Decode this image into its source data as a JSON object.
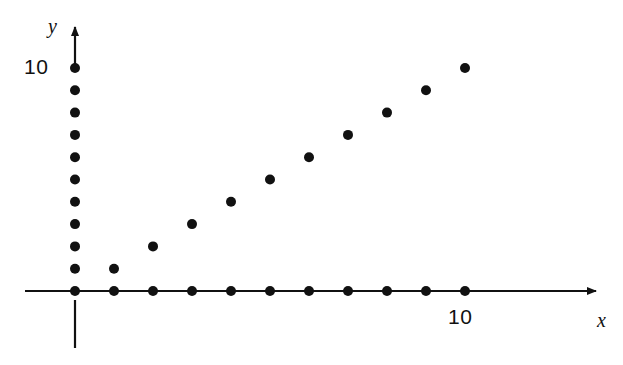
{
  "figure": {
    "background_color": "#ffffff",
    "ink_color": "#111111",
    "width": 623,
    "height": 365
  },
  "axes": {
    "x": {
      "name": "x",
      "icon": "arrow-right-icon",
      "tick_labels": [
        "10"
      ],
      "origin_px": {
        "x": 75,
        "y": 291
      },
      "unit_px": 39.0,
      "line_start_px": 25,
      "line_end_px": 600,
      "below_origin_tick": {
        "from_y": 300,
        "to_y": 348
      }
    },
    "y": {
      "name": "y",
      "icon": "arrow-up-icon",
      "tick_labels": [
        "10"
      ],
      "origin_px": {
        "x": 75,
        "y": 291
      },
      "unit_px": 22.3,
      "line_start_px": 68,
      "line_end_px": 22
    }
  },
  "chart_data": {
    "type": "scatter",
    "title": "",
    "subtitle": "",
    "xlabel": "x",
    "ylabel": "y",
    "xlim": [
      0,
      13.5
    ],
    "ylim": [
      0,
      12
    ],
    "xticks": [
      10
    ],
    "yticks": [
      10
    ],
    "xticklabels": [
      "10"
    ],
    "yticklabels": [
      "10"
    ],
    "grid": false,
    "legend": null,
    "annotations": [],
    "series": [
      {
        "name": "y-axis dots (x = 0)",
        "marker": "filled-circle",
        "marker_radius_px": 5,
        "color": "#111111",
        "x": [
          0,
          0,
          0,
          0,
          0,
          0,
          0,
          0,
          0,
          0,
          0
        ],
        "y": [
          0,
          1,
          2,
          3,
          4,
          5,
          6,
          7,
          8,
          9,
          10
        ]
      },
      {
        "name": "x-axis dots (y = 0)",
        "marker": "filled-circle",
        "marker_radius_px": 5,
        "color": "#111111",
        "x": [
          0,
          1,
          2,
          3,
          4,
          5,
          6,
          7,
          8,
          9,
          10
        ],
        "y": [
          0,
          0,
          0,
          0,
          0,
          0,
          0,
          0,
          0,
          0,
          0
        ]
      },
      {
        "name": "diagonal dots (y = x)",
        "marker": "filled-circle",
        "marker_radius_px": 5,
        "color": "#111111",
        "x": [
          1,
          2,
          3,
          4,
          5,
          6,
          7,
          8,
          9,
          10
        ],
        "y": [
          1,
          2,
          3,
          4,
          5,
          6,
          7,
          8,
          9,
          10
        ]
      }
    ]
  }
}
